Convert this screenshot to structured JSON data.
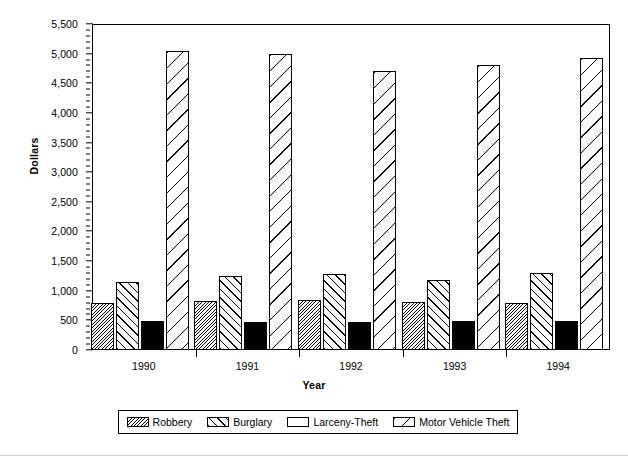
{
  "chart_data": {
    "type": "bar",
    "title": "",
    "subtitle": "",
    "xlabel": "Year",
    "ylabel": "Dollars",
    "categories": [
      "1990",
      "1991",
      "1992",
      "1993",
      "1994"
    ],
    "series": [
      {
        "name": "Robbery",
        "values": [
          790,
          820,
          840,
          810,
          790
        ]
      },
      {
        "name": "Burglary",
        "values": [
          1150,
          1250,
          1280,
          1180,
          1300
        ]
      },
      {
        "name": "Larceny-Theft",
        "values": [
          490,
          480,
          480,
          495,
          490
        ]
      },
      {
        "name": "Motor Vehicle Theft",
        "values": [
          5050,
          4990,
          4710,
          4800,
          4930
        ]
      }
    ],
    "ylim": [
      0,
      5500
    ],
    "ytick_step": 500,
    "yminor_step": 100,
    "ytick_labels": [
      "0",
      "500",
      "1,000",
      "1,500",
      "2,000",
      "2,500",
      "3,000",
      "3,500",
      "4,000",
      "4,500",
      "5,000",
      "5,500"
    ],
    "grid": false,
    "legend_position": "bottom",
    "legend_entries": [
      {
        "label": "Robbery",
        "pattern": "dense-diagonal-hatch"
      },
      {
        "label": "Burglary",
        "pattern": "medium-diagonal-hatch"
      },
      {
        "label": "Larceny-Theft",
        "pattern": "solid-black"
      },
      {
        "label": "Motor Vehicle Theft",
        "pattern": "sparse-diagonal-hatch"
      }
    ],
    "colors": {
      "axis": "#000000",
      "plot_background": "#ffffff",
      "bar_outline": "#000000",
      "larceny_fill": "#000000"
    }
  }
}
